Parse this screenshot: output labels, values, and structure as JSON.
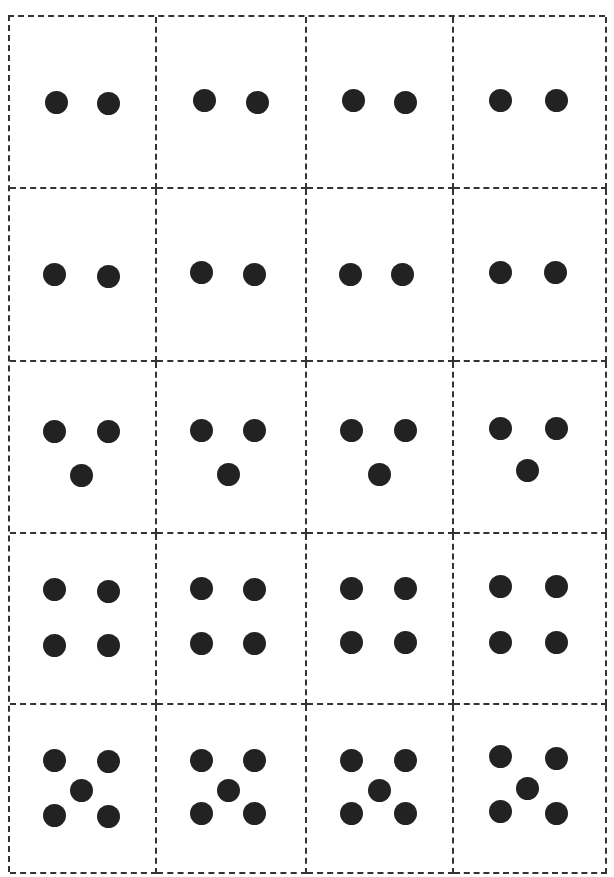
{
  "worksheet": {
    "title": "",
    "columns": 4,
    "rows": 5,
    "dot_color": "#222222",
    "cut_line_color": "#333333",
    "cut_line_style": "dashed",
    "rows_data": [
      {
        "count": 2,
        "pattern": "pair-horizontal"
      },
      {
        "count": 2,
        "pattern": "pair-horizontal"
      },
      {
        "count": 3,
        "pattern": "triangle"
      },
      {
        "count": 4,
        "pattern": "square"
      },
      {
        "count": 5,
        "pattern": "quincunx"
      }
    ]
  },
  "cards": [
    {
      "row": 0,
      "col": 0,
      "count": 2,
      "dots": [
        [
          32,
          50
        ],
        [
          68,
          51
        ]
      ]
    },
    {
      "row": 0,
      "col": 1,
      "count": 2,
      "dots": [
        [
          32,
          49
        ],
        [
          68,
          50
        ]
      ]
    },
    {
      "row": 0,
      "col": 2,
      "count": 2,
      "dots": [
        [
          32,
          49
        ],
        [
          68,
          50
        ]
      ]
    },
    {
      "row": 0,
      "col": 3,
      "count": 2,
      "dots": [
        [
          31,
          49
        ],
        [
          68,
          49
        ]
      ]
    },
    {
      "row": 1,
      "col": 0,
      "count": 2,
      "dots": [
        [
          31,
          50
        ],
        [
          68,
          51
        ]
      ]
    },
    {
      "row": 1,
      "col": 1,
      "count": 2,
      "dots": [
        [
          30,
          49
        ],
        [
          66,
          50
        ]
      ]
    },
    {
      "row": 1,
      "col": 2,
      "count": 2,
      "dots": [
        [
          30,
          50
        ],
        [
          66,
          50
        ]
      ]
    },
    {
      "row": 1,
      "col": 3,
      "count": 2,
      "dots": [
        [
          31,
          49
        ],
        [
          67,
          49
        ]
      ]
    },
    {
      "row": 2,
      "col": 0,
      "count": 3,
      "dots": [
        [
          31,
          41
        ],
        [
          68,
          41
        ],
        [
          49,
          67
        ]
      ]
    },
    {
      "row": 2,
      "col": 1,
      "count": 3,
      "dots": [
        [
          30,
          40
        ],
        [
          66,
          40
        ],
        [
          48,
          66
        ]
      ]
    },
    {
      "row": 2,
      "col": 2,
      "count": 3,
      "dots": [
        [
          31,
          40
        ],
        [
          68,
          40
        ],
        [
          50,
          66
        ]
      ]
    },
    {
      "row": 2,
      "col": 3,
      "count": 3,
      "dots": [
        [
          31,
          39
        ],
        [
          68,
          39
        ],
        [
          49,
          64
        ]
      ]
    },
    {
      "row": 3,
      "col": 0,
      "count": 4,
      "dots": [
        [
          31,
          33
        ],
        [
          68,
          34
        ],
        [
          31,
          66
        ],
        [
          68,
          66
        ]
      ]
    },
    {
      "row": 3,
      "col": 1,
      "count": 4,
      "dots": [
        [
          30,
          32
        ],
        [
          66,
          33
        ],
        [
          30,
          65
        ],
        [
          66,
          65
        ]
      ]
    },
    {
      "row": 3,
      "col": 2,
      "count": 4,
      "dots": [
        [
          31,
          32
        ],
        [
          68,
          32
        ],
        [
          31,
          64
        ],
        [
          68,
          64
        ]
      ]
    },
    {
      "row": 3,
      "col": 3,
      "count": 4,
      "dots": [
        [
          31,
          31
        ],
        [
          68,
          31
        ],
        [
          31,
          64
        ],
        [
          68,
          64
        ]
      ]
    },
    {
      "row": 4,
      "col": 0,
      "count": 5,
      "dots": [
        [
          31,
          33
        ],
        [
          68,
          34
        ],
        [
          49,
          51
        ],
        [
          31,
          66
        ],
        [
          68,
          67
        ]
      ]
    },
    {
      "row": 4,
      "col": 1,
      "count": 5,
      "dots": [
        [
          30,
          33
        ],
        [
          66,
          33
        ],
        [
          48,
          51
        ],
        [
          30,
          65
        ],
        [
          66,
          65
        ]
      ]
    },
    {
      "row": 4,
      "col": 2,
      "count": 5,
      "dots": [
        [
          31,
          33
        ],
        [
          68,
          33
        ],
        [
          50,
          51
        ],
        [
          31,
          65
        ],
        [
          68,
          65
        ]
      ]
    },
    {
      "row": 4,
      "col": 3,
      "count": 5,
      "dots": [
        [
          31,
          31
        ],
        [
          68,
          32
        ],
        [
          49,
          50
        ],
        [
          31,
          64
        ],
        [
          68,
          65
        ]
      ]
    }
  ]
}
